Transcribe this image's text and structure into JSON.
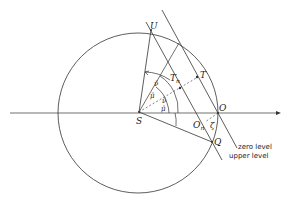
{
  "diagram": {
    "points": {
      "S": "S",
      "O": "O",
      "U": "U",
      "Q": "Q",
      "T": "T",
      "Tn": "T",
      "Tn_sub": "n",
      "On": "O",
      "On_sub": "n"
    },
    "angles": {
      "nu1": "ν̄",
      "nu2": "ν̄",
      "mu1": "μ̄",
      "mu2": "μ̄",
      "zeta": "ζ"
    },
    "line_labels": {
      "zero": "zero level",
      "upper": "upper level"
    }
  }
}
